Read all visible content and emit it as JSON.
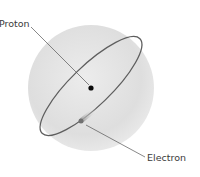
{
  "diagram": {
    "labels": {
      "proton": "Proton",
      "electron": "Electron"
    },
    "colors": {
      "sphere": "#e2e2e2",
      "sphere_edge": "#f2f2f2",
      "orbit": "#5a5a5a",
      "proton": "#0a0a0a",
      "electron": "#6e6e6e",
      "leader": "#555555",
      "label": "#3a3a3a"
    }
  }
}
